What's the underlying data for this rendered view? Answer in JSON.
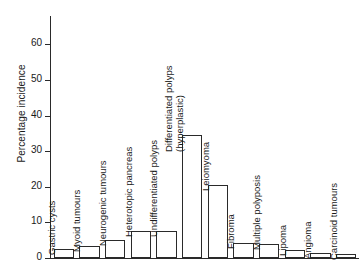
{
  "chart_data": {
    "type": "bar",
    "title": "",
    "subtitle": "",
    "xlabel": "",
    "ylabel": "Percentage incidence",
    "ylim": [
      0,
      68
    ],
    "yticks": [
      0,
      10,
      20,
      30,
      40,
      50,
      60
    ],
    "ytick_labels": [
      "0",
      "10",
      "20",
      "30",
      "40",
      "50",
      "60"
    ],
    "grid": false,
    "legend": null,
    "orientation": "vertical",
    "bar_style": "outlined-white",
    "categories": [
      "Gastric cysts",
      "Myoid tumours",
      "Neurogenic tumours",
      "Heterotopic pancreas",
      "Undifferentiated polyps",
      "Differentiated polyps (hyperplastic)",
      "Leiomyoma",
      "Fibroma",
      "Multiple polyposis",
      "Lipoma",
      "Angioma",
      "Carcinoid tumours"
    ],
    "values": [
      2.5,
      3.5,
      5.0,
      7.5,
      7.7,
      34.5,
      20.5,
      4.2,
      4.0,
      2.2,
      1.4,
      1.1
    ]
  },
  "axis": {
    "y_label": "Percentage incidence",
    "ticks": [
      {
        "value": 60,
        "label": "60"
      },
      {
        "value": 50,
        "label": "50"
      },
      {
        "value": 40,
        "label": "40"
      },
      {
        "value": 30,
        "label": "30"
      },
      {
        "value": 20,
        "label": "20"
      },
      {
        "value": 10,
        "label": "10"
      },
      {
        "value": 0,
        "label": "0"
      }
    ]
  },
  "bars": [
    {
      "label": "Gastric cysts",
      "label_line1": "Gastric cysts",
      "label_line2": "",
      "value": 2.5
    },
    {
      "label": "Myoid tumours",
      "label_line1": "Myoid tumours",
      "label_line2": "",
      "value": 3.5
    },
    {
      "label": "Neurogenic tumours",
      "label_line1": "Neurogenic tumours",
      "label_line2": "",
      "value": 5.0
    },
    {
      "label": "Heterotopic pancreas",
      "label_line1": "Heterotopic pancreas",
      "label_line2": "",
      "value": 7.5
    },
    {
      "label": "Undifferentiated polyps",
      "label_line1": "Undifferentiated polyps",
      "label_line2": "",
      "value": 7.7
    },
    {
      "label": "Differentiated polyps (hyperplastic)",
      "label_line1": "Differentiated polyps",
      "label_line2": "(hyperplastic)",
      "value": 34.5
    },
    {
      "label": "Leiomyoma",
      "label_line1": "Leiomyoma",
      "label_line2": "",
      "value": 20.5
    },
    {
      "label": "Fibroma",
      "label_line1": "Fibroma",
      "label_line2": "",
      "value": 4.2
    },
    {
      "label": "Multiple polyposis",
      "label_line1": "Multiple polyposis",
      "label_line2": "",
      "value": 4.0
    },
    {
      "label": "Lipoma",
      "label_line1": "Lipoma",
      "label_line2": "",
      "value": 2.2
    },
    {
      "label": "Angioma",
      "label_line1": "Angioma",
      "label_line2": "",
      "value": 1.4
    },
    {
      "label": "Carcinoid tumours",
      "label_line1": "Carcinoid tumours",
      "label_line2": "",
      "value": 1.1
    }
  ],
  "colors": {
    "axis": "#2a2a2a",
    "bar_stroke": "#2a2a2a",
    "bar_fill": "#ffffff",
    "text": "#1a1a1a",
    "background": "#ffffff"
  }
}
